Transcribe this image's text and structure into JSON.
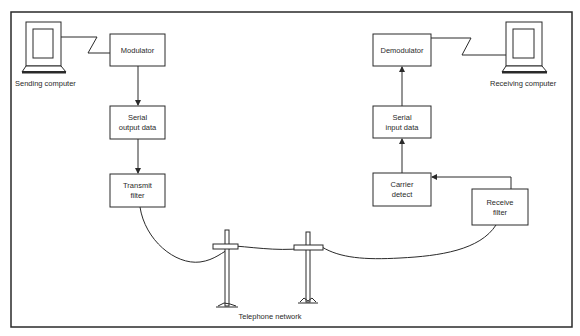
{
  "diagram": {
    "colors": {
      "ink": "#2a2a2a",
      "background": "#ffffff"
    },
    "computers": {
      "sending": {
        "label": "Sending computer",
        "icon": "computer-icon"
      },
      "receiving": {
        "label": "Receiving computer",
        "icon": "computer-icon"
      }
    },
    "transmit_chain": {
      "modulator": {
        "line1": "Modulator",
        "line2": ""
      },
      "serial_output": {
        "line1": "Serial",
        "line2": "output data"
      },
      "transmit_filter": {
        "line1": "Transmit",
        "line2": "filter"
      }
    },
    "receive_chain": {
      "demodulator": {
        "line1": "Demodulator",
        "line2": ""
      },
      "serial_input": {
        "line1": "Serial",
        "line2": "input data"
      },
      "carrier_detect": {
        "line1": "Carrier",
        "line2": "detect"
      },
      "receive_filter": {
        "line1": "Receive",
        "line2": "filter"
      }
    },
    "network": {
      "label": "Telephone network",
      "icon": "telephone-pole-icon"
    }
  }
}
